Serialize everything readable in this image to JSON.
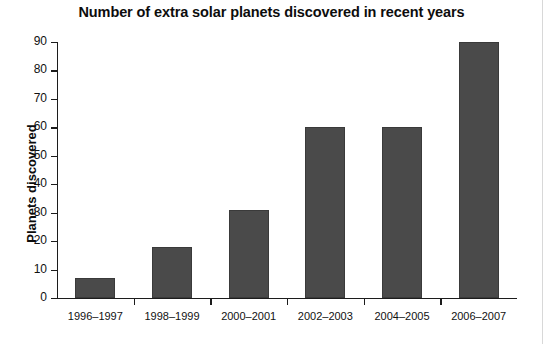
{
  "chart_data": {
    "type": "bar",
    "title": "Number of extra solar planets discovered in recent years",
    "xlabel": "",
    "ylabel": "Planets discovered",
    "categories": [
      "1996–1997",
      "1998–1999",
      "2000–2001",
      "2002–2003",
      "2004–2005",
      "2006–2007"
    ],
    "values": [
      7,
      18,
      31,
      60,
      60,
      90
    ],
    "ylim": [
      0,
      90
    ],
    "ytick_labels": [
      "0",
      "10",
      "20",
      "30",
      "40",
      "50",
      "60",
      "70",
      "80",
      "90"
    ],
    "ytick_values": [
      0,
      10,
      20,
      30,
      40,
      50,
      60,
      70,
      80,
      90
    ],
    "grid": false,
    "legend": "none",
    "bar_color": "#4a4a4a",
    "axis_color": "#1c1c1c",
    "background": "#ffffff"
  }
}
